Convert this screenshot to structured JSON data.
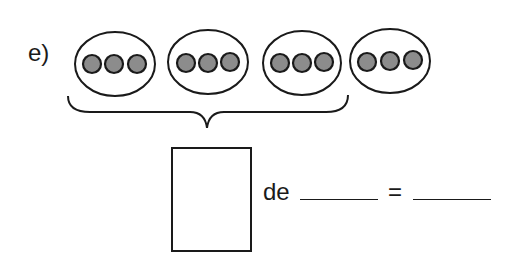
{
  "exercise": {
    "label": "e)",
    "groups": [
      {
        "dots": 3
      },
      {
        "dots": 3
      },
      {
        "dots": 3
      },
      {
        "dots": 3
      }
    ],
    "bracket_covers_groups": 3,
    "equation": {
      "fraction_box": "",
      "connector": "de",
      "blank_1": "",
      "equals": "=",
      "blank_2": ""
    }
  },
  "colors": {
    "stroke": "#1a1a1a",
    "dot_fill": "#8c8c8c",
    "background": "#ffffff"
  }
}
